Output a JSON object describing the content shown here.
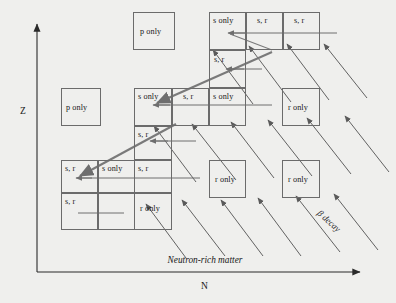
{
  "figure": {
    "type": "diagram",
    "axes": {
      "x_label": "N",
      "y_label": "Z",
      "x_annotation": "Neutron-rich matter",
      "x_arrow_direction": "right",
      "y_arrow_direction": "up"
    },
    "annotations": {
      "beta_decay": "β decay"
    },
    "colors": {
      "background": "#efefed",
      "box_border": "#6b6b6b",
      "axis": "#2a2a2a",
      "s_path": "#6e6e6e",
      "beta_arrow": "#5a5a5a",
      "text": "#1a1a1a"
    },
    "cells": [
      {
        "label": "p only",
        "x": 133,
        "y": 12,
        "w": 42,
        "h": 38
      },
      {
        "label": "s only",
        "x": 209,
        "y": 12,
        "w": 37,
        "h": 38
      },
      {
        "label": "s, r",
        "x": 246,
        "y": 12,
        "w": 37,
        "h": 38
      },
      {
        "label": "s, r",
        "x": 283,
        "y": 12,
        "w": 37,
        "h": 38
      },
      {
        "label": "s, r",
        "x": 209,
        "y": 50,
        "w": 37,
        "h": 38
      },
      {
        "label": "p only",
        "x": 61,
        "y": 88,
        "w": 40,
        "h": 38
      },
      {
        "label": "s only",
        "x": 134,
        "y": 88,
        "w": 38,
        "h": 38
      },
      {
        "label": "s, r",
        "x": 172,
        "y": 88,
        "w": 37,
        "h": 38
      },
      {
        "label": "s only",
        "x": 209,
        "y": 88,
        "w": 37,
        "h": 38
      },
      {
        "label": "r only",
        "x": 282,
        "y": 88,
        "w": 38,
        "h": 38
      },
      {
        "label": "s, r",
        "x": 134,
        "y": 126,
        "w": 38,
        "h": 34
      },
      {
        "label": "s, r",
        "x": 61,
        "y": 160,
        "w": 37,
        "h": 33
      },
      {
        "label": "s only",
        "x": 98,
        "y": 160,
        "w": 37,
        "h": 33
      },
      {
        "label": "s, r",
        "x": 134,
        "y": 160,
        "w": 38,
        "h": 33
      },
      {
        "label": "r only",
        "x": 209,
        "y": 160,
        "w": 37,
        "h": 38
      },
      {
        "label": "r only",
        "x": 282,
        "y": 160,
        "w": 38,
        "h": 38
      },
      {
        "label": "s, r",
        "x": 61,
        "y": 193,
        "w": 37,
        "h": 37
      },
      {
        "label": "",
        "x": 98,
        "y": 193,
        "w": 37,
        "h": 37
      },
      {
        "label": "r only",
        "x": 134,
        "y": 193,
        "w": 38,
        "h": 37
      }
    ]
  }
}
